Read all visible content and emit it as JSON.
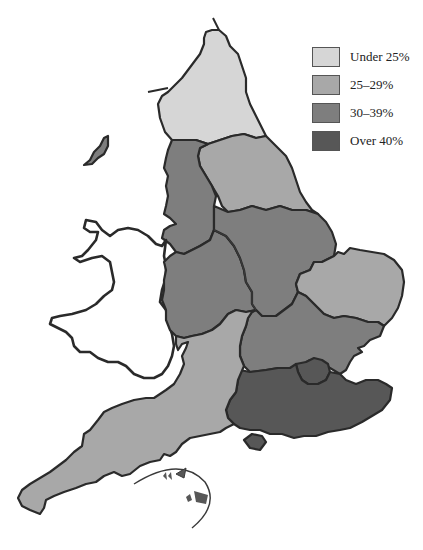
{
  "map": {
    "subject": "England regions",
    "legend": {
      "items": [
        {
          "label": "Under 25%",
          "color": "#d6d6d6"
        },
        {
          "label": "25–29%",
          "color": "#a8a8a8"
        },
        {
          "label": "30–39%",
          "color": "#7e7e7e"
        },
        {
          "label": "Over 40%",
          "color": "#575757"
        }
      ]
    },
    "regions": [
      {
        "name": "North East",
        "class": "Under 25%"
      },
      {
        "name": "Yorkshire and the Humber",
        "class": "25–29%"
      },
      {
        "name": "North West",
        "class": "30–39%"
      },
      {
        "name": "Isle of Man",
        "class": "30–39%"
      },
      {
        "name": "East Midlands",
        "class": "30–39%"
      },
      {
        "name": "West Midlands",
        "class": "30–39%"
      },
      {
        "name": "East of England",
        "class": "25–29%"
      },
      {
        "name": "Home Counties band",
        "class": "30–39%"
      },
      {
        "name": "London",
        "class": "Over 40%"
      },
      {
        "name": "South East",
        "class": "Over 40%"
      },
      {
        "name": "Isle of Wight",
        "class": "Over 40%"
      },
      {
        "name": "South West",
        "class": "25–29%"
      },
      {
        "name": "Channel Islands",
        "class": "Over 40%"
      },
      {
        "name": "Wales",
        "class": "not shaded"
      }
    ]
  }
}
